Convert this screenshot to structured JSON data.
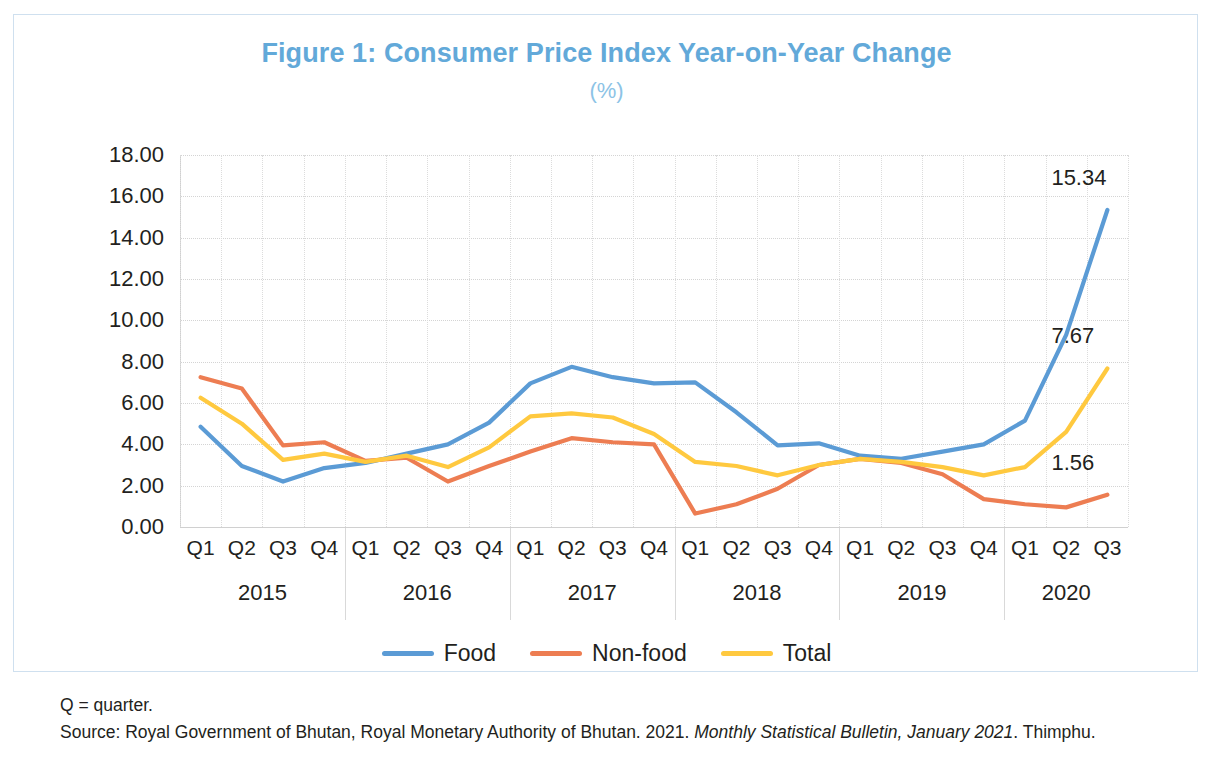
{
  "figure": {
    "title": "Figure 1: Consumer Price Index Year-on-Year Change",
    "subtitle": "(%)",
    "title_color": "#62A9D9",
    "border_color": "#CFE0EF"
  },
  "notes": {
    "abbreviation": "Q = quarter.",
    "source_prefix": "Source: Royal Government of Bhutan, Royal Monetary Authority of Bhutan. 2021. ",
    "source_italic": "Monthly Statistical Bulletin, January 2021",
    "source_suffix": ". Thimphu."
  },
  "legend": {
    "position": "bottom-center",
    "items": [
      {
        "label": "Food",
        "color": "#5B9BD5"
      },
      {
        "label": "Non-food",
        "color": "#ED7D52"
      },
      {
        "label": "Total",
        "color": "#FFC93F"
      }
    ]
  },
  "chart_data": {
    "type": "line",
    "title": "Figure 1: Consumer Price Index Year-on-Year Change",
    "subtitle": "(%)",
    "xlabel": "",
    "ylabel": "",
    "ylim": [
      0,
      18
    ],
    "ytick_step": 2,
    "ytick_labels": [
      "0.00",
      "2.00",
      "4.00",
      "6.00",
      "8.00",
      "10.00",
      "12.00",
      "14.00",
      "16.00",
      "18.00"
    ],
    "grid": true,
    "legend_position": "bottom",
    "quarters": [
      "Q1",
      "Q2",
      "Q3",
      "Q4",
      "Q1",
      "Q2",
      "Q3",
      "Q4",
      "Q1",
      "Q2",
      "Q3",
      "Q4",
      "Q1",
      "Q2",
      "Q3",
      "Q4",
      "Q1",
      "Q2",
      "Q3",
      "Q4",
      "Q1",
      "Q2",
      "Q3"
    ],
    "years": [
      {
        "label": "2015",
        "quarters": 4
      },
      {
        "label": "2016",
        "quarters": 4
      },
      {
        "label": "2017",
        "quarters": 4
      },
      {
        "label": "2018",
        "quarters": 4
      },
      {
        "label": "2019",
        "quarters": 4
      },
      {
        "label": "2020",
        "quarters": 3
      }
    ],
    "series": [
      {
        "name": "Food",
        "color": "#5B9BD5",
        "values": [
          4.85,
          2.95,
          2.2,
          2.85,
          3.1,
          3.55,
          4.0,
          5.05,
          6.95,
          7.75,
          7.25,
          6.95,
          7.0,
          5.55,
          3.95,
          4.05,
          3.45,
          3.3,
          3.65,
          4.0,
          5.15,
          9.3,
          15.34
        ]
      },
      {
        "name": "Non-food",
        "color": "#ED7D52",
        "values": [
          7.25,
          6.7,
          3.95,
          4.1,
          3.2,
          3.35,
          2.2,
          2.95,
          3.65,
          4.3,
          4.1,
          4.0,
          0.65,
          1.1,
          1.85,
          3.0,
          3.3,
          3.1,
          2.55,
          1.35,
          1.1,
          0.95,
          1.56
        ]
      },
      {
        "name": "Total",
        "color": "#FFC93F",
        "values": [
          6.25,
          5.0,
          3.25,
          3.55,
          3.15,
          3.45,
          2.9,
          3.85,
          5.35,
          5.5,
          5.3,
          4.5,
          3.15,
          2.95,
          2.5,
          3.0,
          3.3,
          3.15,
          2.9,
          2.5,
          2.9,
          4.6,
          7.67
        ]
      }
    ],
    "endpoint_labels": [
      {
        "series": "Food",
        "value": "15.34"
      },
      {
        "series": "Total",
        "value": "7.67"
      },
      {
        "series": "Non-food",
        "value": "1.56"
      }
    ]
  }
}
